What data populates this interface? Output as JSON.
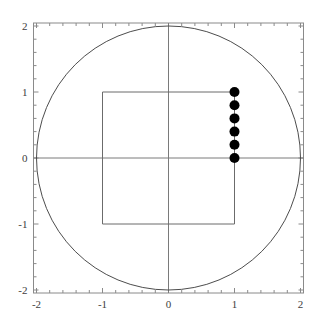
{
  "figure": {
    "title": "",
    "background_color": "#ffffff",
    "width": 321,
    "height": 327
  },
  "chart_data": {
    "type": "scatter",
    "title": "",
    "xlabel": "",
    "ylabel": "",
    "xlim": [
      -2.2,
      2.2
    ],
    "ylim": [
      -2.2,
      2.2
    ],
    "grid": false,
    "legend": null,
    "frame": true,
    "axes_drawn": true,
    "x_ticks": [
      -2,
      -1,
      0,
      1,
      2
    ],
    "y_ticks": [
      -2,
      -1,
      0,
      1,
      2
    ],
    "x_tick_labels": [
      "-2",
      "-1",
      "0",
      "1",
      "2"
    ],
    "y_tick_labels": [
      "-2",
      "-1",
      "0",
      "1",
      "2"
    ],
    "minor_tick_step": 0.2,
    "series": [
      {
        "name": "circle",
        "type": "circle",
        "center": [
          0,
          0
        ],
        "radius": 2,
        "color": "#4d4d4d",
        "fill": "none",
        "linewidth": 1
      },
      {
        "name": "square",
        "type": "polygon",
        "points": [
          [
            -1,
            1
          ],
          [
            1,
            1
          ],
          [
            1,
            -1
          ],
          [
            -1,
            -1
          ]
        ],
        "color": "#6b6b6b",
        "fill": "none",
        "linewidth": 1
      },
      {
        "name": "points",
        "type": "scatter",
        "x": [
          1,
          1,
          1,
          1,
          1,
          1
        ],
        "y": [
          0,
          0.2,
          0.4,
          0.6,
          0.8,
          1
        ],
        "color": "#000000",
        "marker": "o",
        "markersize": 5
      }
    ]
  }
}
